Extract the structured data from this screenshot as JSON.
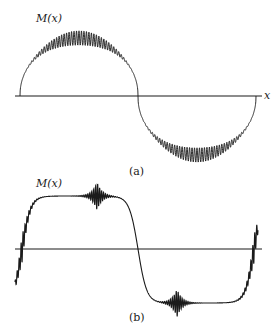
{
  "chart_data": [
    {
      "type": "line",
      "panel": "(a)",
      "title": "",
      "ylabel": "M(x)",
      "xlabel": "x",
      "caption": "(a)",
      "description": "Partial Fourier sum of a square-wave-like magnetization M(x) with dense high-frequency ripple on the plateaus",
      "x_range": [
        0,
        1
      ],
      "y_range": [
        -1,
        1
      ],
      "grid": false,
      "series": [
        {
          "name": "M(x)",
          "x": [
            0,
            0.25,
            0.5,
            0.75,
            1.0
          ],
          "values": [
            0,
            1,
            0,
            -1,
            0
          ]
        }
      ],
      "layout": {
        "axis_y_px": 96,
        "axis_x_start_px": 15,
        "axis_x_end_px": 262,
        "curve_start_px": 20,
        "curve_end_px": 256,
        "top_px": 38,
        "bottom_px": 155,
        "ripple_amplitude_px": 8
      }
    },
    {
      "type": "line",
      "panel": "(b)",
      "title": "",
      "ylabel": "M(x)",
      "xlabel": "",
      "caption": "(b)",
      "description": "Smoothed square-wave M(x) with flat plateaus and Gibbs-like oscillations near the zero crossings",
      "x_range": [
        0,
        1
      ],
      "y_range": [
        -1,
        1
      ],
      "grid": false,
      "series": [
        {
          "name": "M(x)",
          "x": [
            0,
            0.25,
            0.5,
            0.75,
            1.0
          ],
          "values": [
            0,
            1,
            0,
            -1,
            0
          ]
        }
      ],
      "layout": {
        "axis_y_px": 249,
        "axis_x_start_px": 15,
        "axis_x_end_px": 262,
        "curve_start_px": 22,
        "curve_end_px": 254,
        "top_px": 196,
        "bottom_px": 303
      }
    }
  ],
  "labels": {
    "a_ylabel": "M(x)",
    "a_xlabel": "x",
    "a_caption": "(a)",
    "b_ylabel": "M(x)",
    "b_caption": "(b)"
  },
  "colors": {
    "ink": "#1a1a1a",
    "background": "#ffffff"
  }
}
